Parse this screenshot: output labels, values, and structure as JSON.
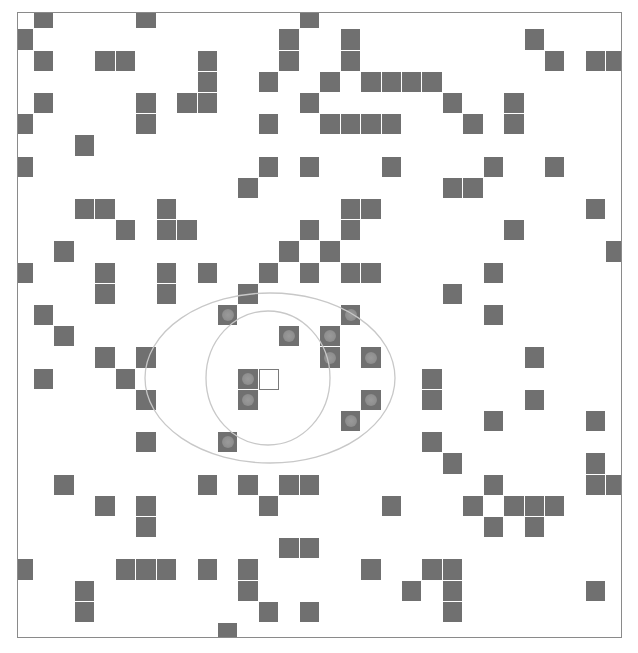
{
  "grid": {
    "columns": 30,
    "rows": 30,
    "origin_x": 12.6,
    "origin_y": 7.1,
    "cell_width": 20.44,
    "cell_height": 21.2,
    "colors": {
      "obstacle": "#707070",
      "sensed_dot": "#939393",
      "agent_border": "#7a7a7a",
      "range_lines": "#c8c8c8",
      "frame": "#8a8a8a"
    }
  },
  "agent": {
    "row": 17,
    "col": 12
  },
  "sensor_ranges": {
    "inner_circle": {
      "cx": 268,
      "cy": 378,
      "rx": 62,
      "ry": 67
    },
    "outer_ellipse": {
      "cx": 270,
      "cy": 378,
      "rx": 125,
      "ry": 85
    }
  },
  "obstacles": [
    {
      "r": 0,
      "c": [
        1,
        6,
        14
      ]
    },
    {
      "r": 1,
      "c": [
        0,
        13,
        16,
        25
      ]
    },
    {
      "r": 2,
      "c": [
        1,
        4,
        5,
        9,
        13,
        16,
        26,
        28,
        29
      ]
    },
    {
      "r": 3,
      "c": [
        9,
        12,
        15,
        17,
        18,
        19,
        20
      ]
    },
    {
      "r": 4,
      "c": [
        1,
        6,
        8,
        9,
        14,
        21,
        24
      ]
    },
    {
      "r": 5,
      "c": [
        0,
        6,
        12,
        15,
        16,
        17,
        18,
        22,
        24
      ]
    },
    {
      "r": 6,
      "c": [
        3
      ]
    },
    {
      "r": 7,
      "c": [
        0,
        12,
        14,
        18,
        23,
        26
      ]
    },
    {
      "r": 8,
      "c": [
        11,
        21,
        22
      ]
    },
    {
      "r": 9,
      "c": [
        3,
        4,
        7,
        16,
        17,
        28
      ]
    },
    {
      "r": 10,
      "c": [
        5,
        7,
        8,
        14,
        16,
        24
      ]
    },
    {
      "r": 11,
      "c": [
        2,
        13,
        15,
        29
      ]
    },
    {
      "r": 12,
      "c": [
        0,
        4,
        7,
        9,
        12,
        14,
        16,
        17,
        23
      ]
    },
    {
      "r": 13,
      "c": [
        4,
        7,
        11,
        21
      ]
    },
    {
      "r": 14,
      "c": [
        1,
        10,
        16,
        23
      ]
    },
    {
      "r": 15,
      "c": [
        2,
        13,
        15
      ]
    },
    {
      "r": 16,
      "c": [
        4,
        6,
        15,
        17,
        25
      ]
    },
    {
      "r": 17,
      "c": [
        1,
        5,
        11,
        20
      ]
    },
    {
      "r": 18,
      "c": [
        6,
        11,
        17,
        20,
        25
      ]
    },
    {
      "r": 19,
      "c": [
        16,
        23,
        28
      ]
    },
    {
      "r": 20,
      "c": [
        6,
        10,
        20
      ]
    },
    {
      "r": 21,
      "c": [
        21,
        28
      ]
    },
    {
      "r": 22,
      "c": [
        2,
        9,
        11,
        13,
        14,
        23,
        28,
        29
      ]
    },
    {
      "r": 23,
      "c": [
        4,
        6,
        12,
        18,
        22,
        24,
        25,
        26
      ]
    },
    {
      "r": 24,
      "c": [
        6,
        23,
        25
      ]
    },
    {
      "r": 25,
      "c": [
        13,
        14
      ]
    },
    {
      "r": 26,
      "c": [
        0,
        5,
        6,
        7,
        9,
        11,
        17,
        20,
        21
      ]
    },
    {
      "r": 27,
      "c": [
        3,
        11,
        19,
        21,
        28
      ]
    },
    {
      "r": 28,
      "c": [
        3,
        12,
        14,
        21
      ]
    },
    {
      "r": 29,
      "c": [
        10
      ]
    }
  ],
  "sensed_cells": [
    {
      "r": 14,
      "c": 10
    },
    {
      "r": 14,
      "c": 16
    },
    {
      "r": 15,
      "c": 13
    },
    {
      "r": 15,
      "c": 15
    },
    {
      "r": 16,
      "c": 15
    },
    {
      "r": 16,
      "c": 17
    },
    {
      "r": 17,
      "c": 11
    },
    {
      "r": 18,
      "c": 11
    },
    {
      "r": 18,
      "c": 17
    },
    {
      "r": 19,
      "c": 16
    },
    {
      "r": 20,
      "c": 10
    }
  ]
}
